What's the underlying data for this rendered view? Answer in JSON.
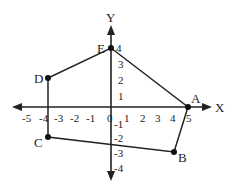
{
  "diagram": {
    "type": "coordinate-plane-polygon",
    "axes": {
      "x_label": "X",
      "y_label": "Y",
      "origin_label": "0",
      "x_ticks": [
        "-5",
        "-4",
        "-3",
        "-2",
        "-1",
        "1",
        "2",
        "3",
        "4",
        "5"
      ],
      "y_ticks_positive": [
        "1",
        "2",
        "3",
        "4"
      ],
      "y_ticks_negative": [
        "-1",
        "-2",
        "-3",
        "-4"
      ]
    },
    "points": [
      {
        "name": "A",
        "x": 5,
        "y": 0
      },
      {
        "name": "B",
        "x": 4,
        "y": -3
      },
      {
        "name": "C",
        "x": -4,
        "y": -2
      },
      {
        "name": "D",
        "x": -4,
        "y": 2
      },
      {
        "name": "E",
        "x": 0,
        "y": 4
      }
    ],
    "polygon_order": [
      "A",
      "B",
      "C",
      "D",
      "E"
    ]
  }
}
